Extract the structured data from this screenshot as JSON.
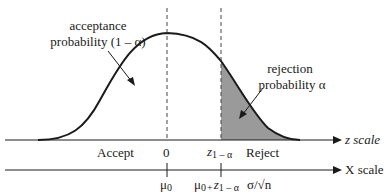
{
  "diagram": {
    "type": "one-sided hypothesis test normal distribution",
    "annotations": {
      "acceptance_line1": "acceptance",
      "acceptance_line2": "probability (1 – α)",
      "rejection_line1": "rejection",
      "rejection_line2": "probability α"
    },
    "z_axis": {
      "label": "z scale",
      "ticks": {
        "zero": "0",
        "critical_base": "z",
        "critical_sub": "1 – α"
      },
      "regions": {
        "accept": "Accept",
        "reject": "Reject"
      }
    },
    "x_axis": {
      "label": "X scale",
      "ticks": {
        "mu0_base": "μ",
        "mu0_sub": "0",
        "crit_mu_base": "μ",
        "crit_mu_sub": "0",
        "crit_plus": "+",
        "crit_z_base": "z",
        "crit_z_sub": "1 – α",
        "crit_sigma": "σ/√n"
      }
    },
    "colors": {
      "curve": "#1a1a1a",
      "shade": "#9a9a9a",
      "axis": "#1a1a1a"
    }
  }
}
